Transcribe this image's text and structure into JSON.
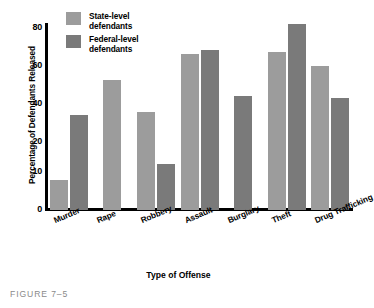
{
  "caption": "FIGURE 7–5",
  "colors": {
    "state": "#9c9c9c",
    "federal": "#7a7a7a",
    "axis": "#000000",
    "caption": "#8a8a8a",
    "background": "#ffffff"
  },
  "legend": {
    "position": "top-left-inside",
    "items": [
      {
        "label_line1": "State-level",
        "label_line2": "defendants",
        "color": "#9c9c9c"
      },
      {
        "label_line1": "Federal-level",
        "label_line2": "defendants",
        "color": "#7a7a7a"
      }
    ]
  },
  "chart_data": {
    "type": "bar",
    "title": "",
    "subtitle": "",
    "xlabel": "Type of Offense",
    "ylabel": "Percentage of Defendants Released",
    "ylim": [
      0,
      80
    ],
    "ytick_labels": [
      "0",
      "10",
      "20",
      "40",
      "60",
      "80"
    ],
    "ytick_values": [
      0,
      10,
      20,
      40,
      60,
      80
    ],
    "grid": false,
    "legend_position": "upper left",
    "categories": [
      "Murder",
      "Rape",
      "Robbery",
      "Assault",
      "Burglary",
      "Theft",
      "Drug Trafficking"
    ],
    "series": [
      {
        "name": "State-level defendants",
        "color": "#9c9c9c",
        "values": [
          13,
          56,
          42,
          67,
          null,
          68,
          62
        ]
      },
      {
        "name": "Federal-level defendants",
        "color": "#7a7a7a",
        "values": [
          41,
          null,
          20,
          69,
          49,
          80,
          48
        ]
      }
    ]
  }
}
